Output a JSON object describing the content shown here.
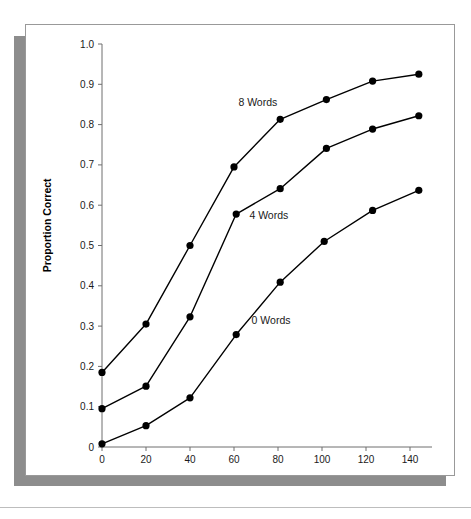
{
  "figure": {
    "top_faint_text": "",
    "colors": {
      "line": "#000000",
      "marker": "#000000",
      "axis": "#6e6e6e",
      "frame": "#999999",
      "shadow": "#8d8d8d",
      "background": "#ffffff"
    }
  },
  "chart_data": {
    "type": "line",
    "title": "",
    "xlabel": "Flash Duration in Milliseconds",
    "ylabel": "Proportion Correct",
    "xlim": [
      0,
      150
    ],
    "ylim": [
      0,
      1.0
    ],
    "xticks": [
      0,
      20,
      40,
      60,
      80,
      100,
      120,
      140
    ],
    "xtick_labels": [
      "0",
      "20",
      "40",
      "60",
      "80",
      "100",
      "120",
      "140"
    ],
    "yticks": [
      0,
      0.1,
      0.2,
      0.3,
      0.4,
      0.5,
      0.6,
      0.7,
      0.8,
      0.9,
      1.0
    ],
    "ytick_labels": [
      "0",
      "0.1",
      "0.2",
      "0.3",
      "0.4",
      "0.5",
      "0.6",
      "0.7",
      "0.8",
      "0.9",
      "1.0"
    ],
    "grid": false,
    "legend_position": "inline-annotations",
    "marker": "filled-circle",
    "series": [
      {
        "name": "8 Words",
        "label": "8 Words",
        "label_x": 62,
        "label_y": 0.855,
        "x": [
          0,
          20,
          40,
          60,
          81,
          102,
          123,
          144
        ],
        "values": [
          0.185,
          0.305,
          0.5,
          0.695,
          0.813,
          0.862,
          0.908,
          0.925
        ]
      },
      {
        "name": "4 Words",
        "label": "4 Words",
        "label_x": 67,
        "label_y": 0.575,
        "x": [
          0,
          20,
          40,
          61,
          81,
          102,
          123,
          144
        ],
        "values": [
          0.095,
          0.151,
          0.323,
          0.578,
          0.641,
          0.741,
          0.789,
          0.822
        ]
      },
      {
        "name": "0 Words",
        "label": "0 Words",
        "label_x": 68,
        "label_y": 0.315,
        "x": [
          0,
          20,
          40,
          61,
          81,
          101,
          123,
          144
        ],
        "values": [
          0.008,
          0.053,
          0.122,
          0.279,
          0.409,
          0.51,
          0.587,
          0.637
        ]
      }
    ]
  }
}
